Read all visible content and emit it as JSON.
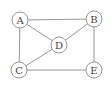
{
  "diagram": {
    "type": "undirected-graph",
    "nodes": [
      {
        "id": "A",
        "label": "A",
        "x": 20,
        "y": 20
      },
      {
        "id": "B",
        "label": "B",
        "x": 94,
        "y": 19
      },
      {
        "id": "D",
        "label": "D",
        "x": 59,
        "y": 45
      },
      {
        "id": "C",
        "label": "C",
        "x": 19,
        "y": 70
      },
      {
        "id": "E",
        "label": "E",
        "x": 94,
        "y": 70
      }
    ],
    "edges": [
      {
        "from": "A",
        "to": "B"
      },
      {
        "from": "A",
        "to": "D"
      },
      {
        "from": "A",
        "to": "C"
      },
      {
        "from": "B",
        "to": "D"
      },
      {
        "from": "B",
        "to": "E"
      },
      {
        "from": "D",
        "to": "C"
      },
      {
        "from": "C",
        "to": "E"
      }
    ],
    "node_radius": 8,
    "colors": {
      "stroke": "#8a8a8a",
      "label": "#444444",
      "fill": "#ffffff"
    }
  }
}
